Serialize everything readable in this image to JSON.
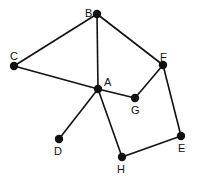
{
  "graph": {
    "nodes": [
      {
        "id": "A",
        "x": 98,
        "y": 89,
        "lx": 104,
        "ly": 86
      },
      {
        "id": "B",
        "x": 97,
        "y": 14,
        "lx": 85,
        "ly": 17
      },
      {
        "id": "C",
        "x": 14,
        "y": 66,
        "lx": 10,
        "ly": 60
      },
      {
        "id": "D",
        "x": 59,
        "y": 139,
        "lx": 54,
        "ly": 155
      },
      {
        "id": "E",
        "x": 181,
        "y": 136,
        "lx": 178,
        "ly": 152
      },
      {
        "id": "F",
        "x": 163,
        "y": 65,
        "lx": 160,
        "ly": 61
      },
      {
        "id": "G",
        "x": 135,
        "y": 98,
        "lx": 131,
        "ly": 114
      },
      {
        "id": "H",
        "x": 122,
        "y": 157,
        "lx": 117,
        "ly": 173
      }
    ],
    "edges": [
      [
        "B",
        "C"
      ],
      [
        "B",
        "A"
      ],
      [
        "B",
        "F"
      ],
      [
        "C",
        "A"
      ],
      [
        "A",
        "G"
      ],
      [
        "G",
        "F"
      ],
      [
        "A",
        "D"
      ],
      [
        "A",
        "H"
      ],
      [
        "H",
        "E"
      ],
      [
        "E",
        "F"
      ]
    ],
    "node_color": "#111111",
    "edge_color": "#111111"
  }
}
